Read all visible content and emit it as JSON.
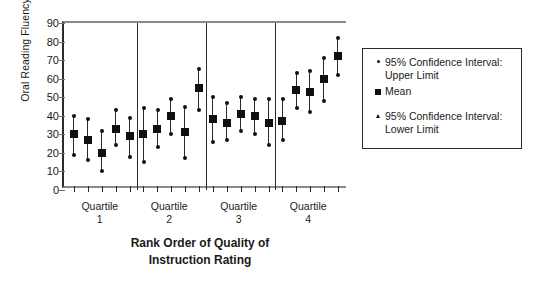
{
  "chart_data": {
    "type": "scatter",
    "title": "",
    "xlabel": "Rank Order of Quality of Instruction Rating",
    "ylabel": "Oral Reading Fluency",
    "ylim": [
      0,
      90
    ],
    "yticks": [
      0,
      10,
      20,
      30,
      40,
      50,
      60,
      70,
      80,
      90
    ],
    "grid": false,
    "legend_position": "right",
    "group_label_prefix": "Quartile",
    "groups": [
      "1",
      "2",
      "3",
      "4"
    ],
    "series": [
      {
        "name": "95% Confidence Interval: Upper Limit",
        "glyph": "dot"
      },
      {
        "name": "Mean",
        "glyph": "square"
      },
      {
        "name": "95% Confidence Interval: Lower Limit",
        "glyph": "triangle"
      }
    ],
    "points": [
      {
        "group": "1",
        "index": 1,
        "mean": 30,
        "upper": 40,
        "lower": 19
      },
      {
        "group": "1",
        "index": 2,
        "mean": 27,
        "upper": 38,
        "lower": 16
      },
      {
        "group": "1",
        "index": 3,
        "mean": 20,
        "upper": 32,
        "lower": 10
      },
      {
        "group": "1",
        "index": 4,
        "mean": 33,
        "upper": 43,
        "lower": 24
      },
      {
        "group": "1",
        "index": 5,
        "mean": 29,
        "upper": 39,
        "lower": 18
      },
      {
        "group": "2",
        "index": 6,
        "mean": 30,
        "upper": 44,
        "lower": 15
      },
      {
        "group": "2",
        "index": 7,
        "mean": 33,
        "upper": 43,
        "lower": 23
      },
      {
        "group": "2",
        "index": 8,
        "mean": 40,
        "upper": 49,
        "lower": 30
      },
      {
        "group": "2",
        "index": 9,
        "mean": 31,
        "upper": 45,
        "lower": 17
      },
      {
        "group": "2",
        "index": 10,
        "mean": 55,
        "upper": 65,
        "lower": 43
      },
      {
        "group": "3",
        "index": 11,
        "mean": 38,
        "upper": 50,
        "lower": 26
      },
      {
        "group": "3",
        "index": 12,
        "mean": 36,
        "upper": 47,
        "lower": 27
      },
      {
        "group": "3",
        "index": 13,
        "mean": 41,
        "upper": 50,
        "lower": 32
      },
      {
        "group": "3",
        "index": 14,
        "mean": 40,
        "upper": 49,
        "lower": 30
      },
      {
        "group": "3",
        "index": 15,
        "mean": 36,
        "upper": 49,
        "lower": 24
      },
      {
        "group": "4",
        "index": 16,
        "mean": 37,
        "upper": 49,
        "lower": 27
      },
      {
        "group": "4",
        "index": 17,
        "mean": 54,
        "upper": 63,
        "lower": 44
      },
      {
        "group": "4",
        "index": 18,
        "mean": 53,
        "upper": 64,
        "lower": 42
      },
      {
        "group": "4",
        "index": 19,
        "mean": 60,
        "upper": 71,
        "lower": 48
      },
      {
        "group": "4",
        "index": 20,
        "mean": 72,
        "upper": 82,
        "lower": 62
      }
    ]
  },
  "legend": {
    "entries": [
      "95% Confidence Interval: Upper Limit",
      "Mean",
      "95% Confidence Interval: Lower Limit"
    ]
  },
  "axis": {
    "y_title": "Oral Reading Fluency",
    "x_title_line1": "Rank Order of Quality of",
    "x_title_line2": "Instruction Rating"
  },
  "groups": [
    {
      "label": "Quartile",
      "number": "1"
    },
    {
      "label": "Quartile",
      "number": "2"
    },
    {
      "label": "Quartile",
      "number": "3"
    },
    {
      "label": "Quartile",
      "number": "4"
    }
  ]
}
